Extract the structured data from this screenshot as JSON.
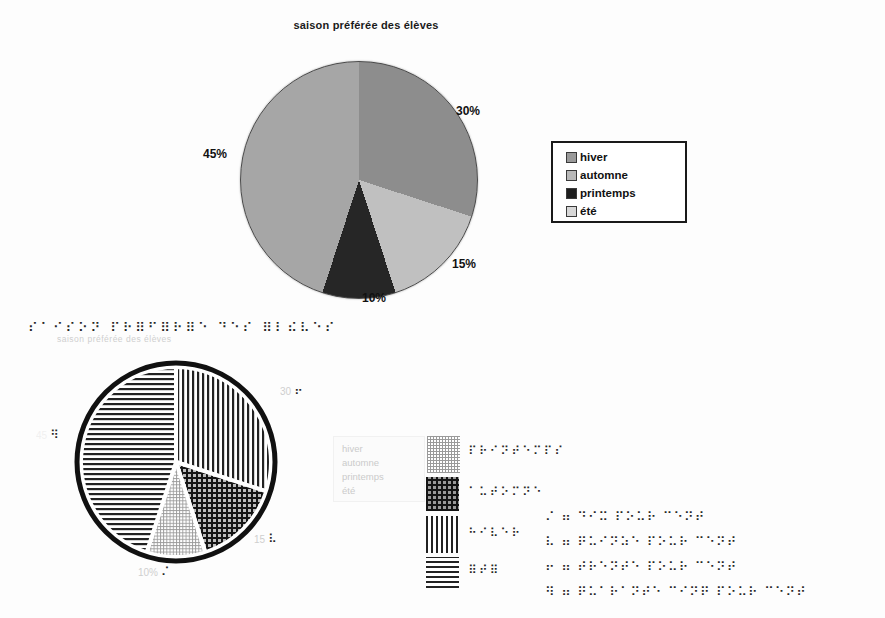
{
  "chart_data": [
    {
      "type": "pie",
      "title": "saison préférée des élèves",
      "legend_position": "right",
      "slices": [
        {
          "label": "hiver",
          "value": 30,
          "pct_label": "30%",
          "color": "#8d8d8d",
          "legend_swatch": "#9a9a9a"
        },
        {
          "label": "automne",
          "value": 15,
          "pct_label": "15%",
          "color": "#c0c0c0",
          "legend_swatch": "#b8b8b8"
        },
        {
          "label": "printemps",
          "value": 10,
          "pct_label": "10%",
          "color": "#262626",
          "legend_swatch": "#1e1e1e"
        },
        {
          "label": "été",
          "value": 45,
          "pct_label": "45%",
          "color": "#a6a6a6",
          "legend_swatch": "#d8d8d8"
        }
      ]
    },
    {
      "type": "pie",
      "variant": "tactile-braille",
      "title_braille": "⠎⠁⠊⠎⠕⠝ ⠏⠗⠿⠋⠿⠗⠿⠑ ⠙⠑⠎ ⠿⠇⠮⠧⠑⠎",
      "title_ghost": "saison préférée des élèves",
      "slices": [
        {
          "label": "hiver",
          "value": 30,
          "pattern": "pat-vertical",
          "braille_mark": "⠖",
          "ghost_label": "30"
        },
        {
          "label": "automne",
          "value": 15,
          "pattern": "pat-crosshatch",
          "braille_mark": "⠧",
          "ghost_label": "15"
        },
        {
          "label": "printemps",
          "value": 10,
          "pattern": "pat-dotgrid",
          "braille_mark": "⠌",
          "ghost_label": "10%"
        },
        {
          "label": "été",
          "value": 45,
          "pattern": "pat-horizontal",
          "braille_mark": "⠻",
          "ghost_label": "45"
        }
      ],
      "legend_braille": [
        {
          "pattern": "pat-dotgrid",
          "braille": "⠏⠗⠊⠝⠞⠑⠍⠏⠎",
          "meaning": "printemps"
        },
        {
          "pattern": "pat-crosshatch",
          "braille": "⠁⠥⠞⠕⠍⠝⠑",
          "meaning": "automne"
        },
        {
          "pattern": "pat-vertical",
          "braille": "⠓⠊⠧⠑⠗",
          "meaning": "hiver"
        },
        {
          "pattern": "pat-horizontal",
          "braille": "⠿⠞⠿",
          "meaning": "été"
        }
      ],
      "ghost_legend": [
        "hiver",
        "automne",
        "printemps",
        "été"
      ],
      "key_lines": [
        {
          "braille": "⠌ ⠶ ⠙⠊⠭ ⠏⠕⠥⠗ ⠉⠑⠝⠞",
          "meaning": "10 pour cent"
        },
        {
          "braille": "⠧ ⠶ ⠟⠥⠊⠝⠵⠑ ⠏⠕⠥⠗ ⠉⠑⠝⠞",
          "meaning": "15 pour cent"
        },
        {
          "braille": "⠖ ⠶ ⠞⠗⠑⠝⠞⠑ ⠏⠕⠥⠗ ⠉⠑⠝⠞",
          "meaning": "30 pour cent"
        },
        {
          "braille": "⠻ ⠶ ⠟⠥⠁⠗⠁⠝⠞⠑ ⠉⠊⠝⠟ ⠏⠕⠥⠗ ⠉⠑⠝⠞",
          "meaning": "45 pour cent"
        }
      ]
    }
  ]
}
